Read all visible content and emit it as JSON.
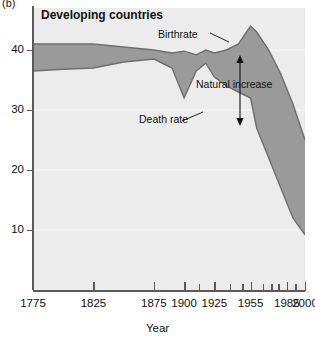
{
  "panel": {
    "tag": "(b)"
  },
  "title": "Developing countries",
  "axes": {
    "xlabel": "Year",
    "ylabel": "",
    "xticks_major": [
      1775,
      1825,
      1875,
      1900,
      1925,
      1955,
      1985,
      2000
    ],
    "xticks_minor": [
      1912,
      1938,
      1948,
      1965,
      1972,
      1978,
      1992
    ],
    "yticks": [
      10,
      20,
      30,
      40
    ],
    "xlim": [
      1775,
      2000
    ],
    "ylim": [
      0,
      47
    ],
    "grid": true
  },
  "annotations": {
    "birthrate": "Birthrate",
    "death_rate": "Death rate",
    "natural_increase": "Natural increase"
  },
  "colors": {
    "fill": "#9a9a9a",
    "line": "#6e6e6e",
    "plot_bg": "#ececec",
    "axis": "#5a5a5a",
    "text": "#111111"
  },
  "chart_data": {
    "type": "area",
    "title": "Developing countries",
    "xlabel": "Year",
    "ylabel": "Rate per 1,000 population",
    "xlim": [
      1775,
      2000
    ],
    "ylim": [
      0,
      47
    ],
    "grid": true,
    "legend": "none",
    "shaded_band_meaning": "Natural increase (birthrate minus death rate)",
    "x": [
      1775,
      1800,
      1825,
      1850,
      1875,
      1890,
      1900,
      1910,
      1918,
      1925,
      1935,
      1945,
      1950,
      1955,
      1960,
      1970,
      1980,
      1990,
      2000
    ],
    "series": [
      {
        "name": "Birthrate",
        "values": [
          41.0,
          41.0,
          41.0,
          40.5,
          40.0,
          39.5,
          39.8,
          39.2,
          40.0,
          39.5,
          40.0,
          41.0,
          42.5,
          44.0,
          43.0,
          40.0,
          36.0,
          31.0,
          25.0
        ]
      },
      {
        "name": "Death rate",
        "values": [
          36.5,
          36.8,
          37.0,
          38.0,
          38.5,
          37.0,
          32.0,
          36.5,
          37.8,
          35.5,
          34.0,
          33.0,
          32.5,
          32.0,
          27.0,
          22.0,
          17.0,
          12.0,
          9.2
        ]
      }
    ]
  }
}
